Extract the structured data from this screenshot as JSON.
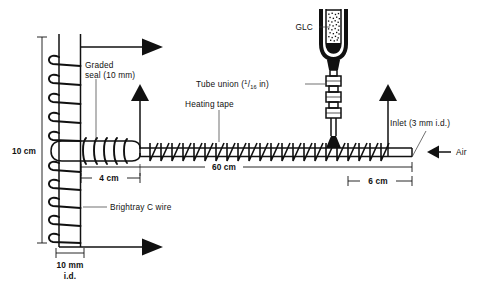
{
  "figure": {
    "background_color": "#ffffff",
    "ink_color": "#111111"
  },
  "labels": {
    "glc": "GLC",
    "graded_seal_line1": "Graded",
    "graded_seal_line2": "seal (10 mm)",
    "tube_union_prefix": "Tube union (",
    "tube_union_frac_num": "1",
    "tube_union_frac_den": "16",
    "tube_union_suffix": " in)",
    "heating_tape": "Heating tape",
    "inlet": "Inlet (3 mm i.d.)",
    "air": "Air",
    "brightray": "Brightray C wire"
  },
  "dimensions": {
    "height_10cm": "10 cm",
    "span_4cm": "4 cm",
    "span_60cm": "60 cm",
    "span_6cm": "6 cm",
    "bore_line1": "10 mm",
    "bore_line2": "i.d."
  },
  "flow_arrows": {
    "top_arrow": "flow-arrow-top-right",
    "bottom_arrow": "flow-arrow-bottom-right",
    "vertical_left_arrow": "flow-arrow-up-left",
    "vertical_right_arrow": "flow-arrow-up-right",
    "air_arrow": "air-inlet-arrow-left"
  }
}
